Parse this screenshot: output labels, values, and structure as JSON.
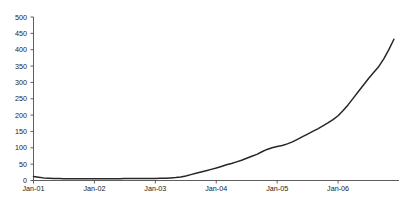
{
  "chart_data": {
    "type": "line",
    "title": "",
    "subtitle": "",
    "xlabel": "",
    "ylabel": "",
    "grid": false,
    "legend": false,
    "legend_position": "none",
    "ylim": [
      0,
      500
    ],
    "yticks": [
      0,
      50,
      100,
      150,
      200,
      250,
      300,
      350,
      400,
      450,
      500
    ],
    "ytick_labels": [
      "0",
      "50",
      "100",
      "150",
      "200",
      "250",
      "300",
      "350",
      "400",
      "450",
      "500"
    ],
    "xtick_labels": [
      "Jan-01",
      "Jan-02",
      "Jan-03",
      "Jan-04",
      "Jan-05",
      "Jan-06"
    ],
    "xtick_values": [
      0,
      12,
      24,
      36,
      48,
      60
    ],
    "xlim": [
      0,
      72
    ],
    "line_color": "#262626",
    "axis_color": "#4d4d4d",
    "background_color": "#ffffff",
    "x": [
      0,
      1,
      2,
      3,
      4,
      5,
      6,
      7,
      8,
      9,
      10,
      11,
      12,
      13,
      14,
      15,
      16,
      17,
      18,
      19,
      20,
      21,
      22,
      23,
      24,
      25,
      26,
      27,
      28,
      29,
      30,
      31,
      32,
      33,
      34,
      35,
      36,
      37,
      38,
      39,
      40,
      41,
      42,
      43,
      44,
      45,
      46,
      47,
      48,
      49,
      50,
      51,
      52,
      53,
      54,
      55,
      56,
      57,
      58,
      59,
      60,
      61,
      62,
      63,
      64,
      65,
      66,
      67,
      68,
      69,
      70,
      71
    ],
    "series": [
      {
        "name": "series-1",
        "values": [
          12,
          10,
          8,
          7,
          6,
          6,
          5,
          5,
          5,
          5,
          5,
          5,
          5,
          5,
          5,
          5,
          5,
          5,
          6,
          6,
          6,
          6,
          6,
          6,
          6,
          7,
          7,
          8,
          9,
          11,
          14,
          18,
          22,
          26,
          30,
          34,
          38,
          43,
          48,
          52,
          57,
          62,
          68,
          74,
          80,
          88,
          95,
          100,
          104,
          107,
          112,
          118,
          126,
          134,
          142,
          150,
          158,
          167,
          176,
          186,
          198,
          214,
          232,
          252,
          272,
          292,
          312,
          330,
          348,
          372,
          400,
          432
        ]
      }
    ]
  },
  "axes": {
    "y_axis_name": "y-axis",
    "x_axis_name": "x-axis"
  }
}
